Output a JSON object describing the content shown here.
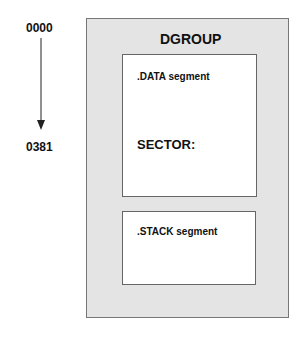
{
  "addresses": {
    "start": "0000",
    "end": "0381"
  },
  "group": {
    "title": "DGROUP",
    "segments": [
      {
        "label": ".DATA segment",
        "content": "SECTOR:"
      },
      {
        "label": ".STACK segment"
      }
    ]
  },
  "colors": {
    "group_fill": "#e4e4e4",
    "segment_fill": "#ffffff",
    "border": "#666666"
  }
}
